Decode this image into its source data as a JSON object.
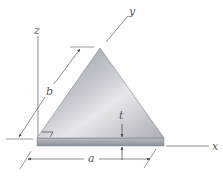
{
  "figure": {
    "axes": {
      "x": "x",
      "y": "y",
      "z": "z"
    },
    "dimensions": {
      "base": "a",
      "side": "b",
      "thickness": "t"
    },
    "colors": {
      "plate_light": "#e4e6ea",
      "plate_dark": "#8e939b",
      "plate_edge": "#9a9ea6",
      "lines": "#6b6f75",
      "background": "#ffffff"
    }
  }
}
